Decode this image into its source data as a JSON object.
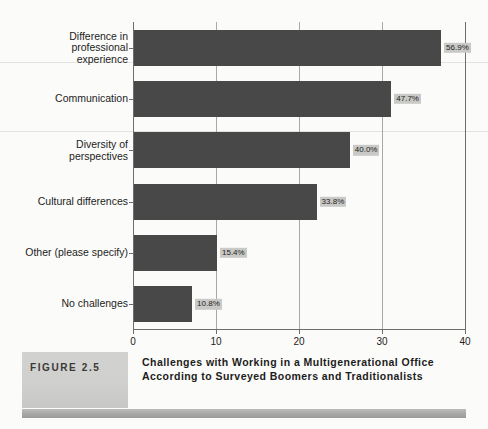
{
  "figure": {
    "tag": "FIGURE 2.5",
    "caption": "Challenges with Working in a Multigenerational Office According to Surveyed Boomers and Traditionalists"
  },
  "colors": {
    "bar": "#484848",
    "label_background": "#c9c9c7",
    "axis": "#6d6d6d",
    "gridline": "#a8a8a6",
    "page_background": "#fbfbfa",
    "figure_box": "#cfcfcd"
  },
  "chart_data": {
    "type": "bar",
    "orientation": "horizontal",
    "title": "",
    "xlabel": "",
    "ylabel": "",
    "xlim": [
      0,
      40
    ],
    "xticks": [
      0,
      10,
      20,
      30,
      40
    ],
    "xtick_labels": [
      "0",
      "10",
      "20",
      "30",
      "40"
    ],
    "grid": true,
    "legend": "none",
    "categories": [
      "Difference in\nprofessional\nexperience",
      "Communication",
      "Diversity of\nperspectives",
      "Cultural differences",
      "Other (please specify)",
      "No challenges"
    ],
    "values": [
      37.0,
      31.0,
      26.0,
      22.0,
      10.0,
      7.0
    ],
    "data_labels": [
      "56.9%",
      "47.7%",
      "40.0%",
      "33.8%",
      "15.4%",
      "10.8%"
    ]
  }
}
